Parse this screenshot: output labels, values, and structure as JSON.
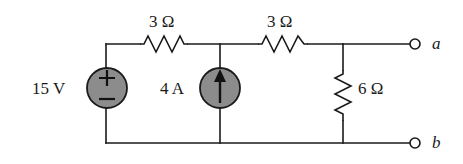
{
  "figure": {
    "type": "circuit-schematic",
    "title": "",
    "background_color": "#ffffff",
    "wire_color": "#1a1a1a",
    "source_fill_color": "#8c8c8c",
    "source_stroke_color": "#1a1a1a",
    "text_color": "#1a1a1a"
  },
  "sources": {
    "voltage": {
      "label": "15 V",
      "polarity_plus": "+",
      "polarity_minus": "−",
      "symbol_name": "voltage-source"
    },
    "current": {
      "label": "4 A",
      "direction": "up",
      "symbol_name": "current-source"
    }
  },
  "resistors": {
    "r1": {
      "label": "3 Ω",
      "orientation": "horizontal"
    },
    "r2": {
      "label": "3 Ω",
      "orientation": "horizontal"
    },
    "r3": {
      "label": "6 Ω",
      "orientation": "vertical"
    }
  },
  "terminals": {
    "a": {
      "label": "a"
    },
    "b": {
      "label": "b"
    }
  }
}
